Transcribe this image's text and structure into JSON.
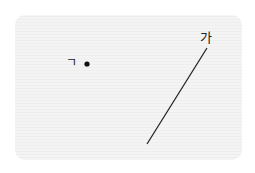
{
  "diagram": {
    "point": {
      "label": "ㄱ",
      "x": 87,
      "y": 64
    },
    "line": {
      "label": "가",
      "x1": 147,
      "y1": 144,
      "x2": 207,
      "y2": 48
    },
    "colors": {
      "panel": "#f3f3f3",
      "stroke": "#222222"
    }
  }
}
